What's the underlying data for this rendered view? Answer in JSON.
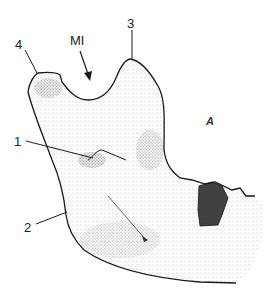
{
  "figure": {
    "labels": [
      {
        "id": "label-4",
        "text": "4"
      },
      {
        "id": "label-mi",
        "text": "MI"
      },
      {
        "id": "label-3",
        "text": "3"
      },
      {
        "id": "label-1",
        "text": "1"
      },
      {
        "id": "label-2",
        "text": "2"
      },
      {
        "id": "label-a",
        "text": "A"
      }
    ],
    "colors": {
      "outline": "#1a1a1a",
      "stipple": "#555555",
      "shadow": "#2a2a2a",
      "background": "#ffffff"
    }
  }
}
